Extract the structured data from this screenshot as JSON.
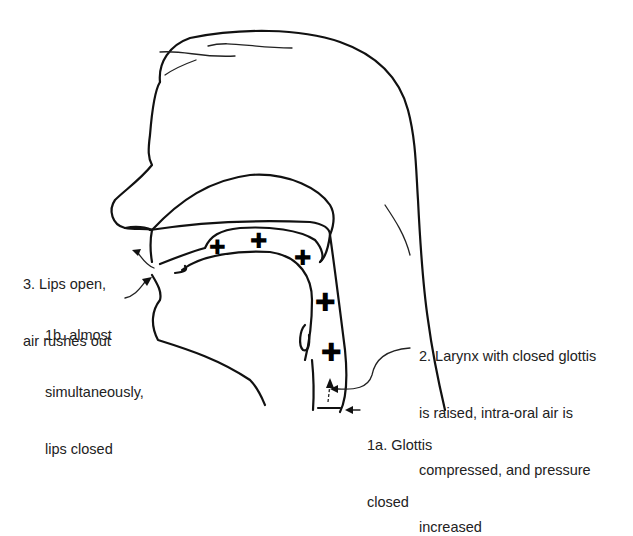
{
  "figure": {
    "stroke_color": "#111111",
    "background": "#ffffff"
  },
  "labels": {
    "step3": [
      "3. Lips open,",
      "air rushes out"
    ],
    "step1b": [
      "1b. almost",
      "simultaneously,",
      "lips closed"
    ],
    "step2": [
      "2. Larynx with closed glottis",
      "is raised, intra-oral air is",
      "compressed, and pressure",
      "increased"
    ],
    "step1a": [
      "1a. Glottis",
      "closed"
    ]
  },
  "pressure_marks": {
    "symbol": "+",
    "meaning": "increased air pressure",
    "count": 5
  }
}
